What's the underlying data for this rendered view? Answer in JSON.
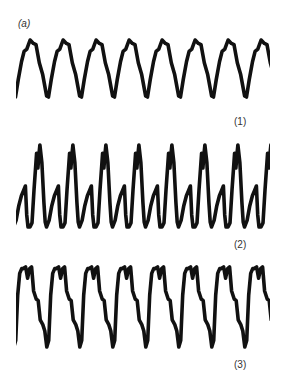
{
  "figure": {
    "panel_label": "(a)",
    "trace_labels": [
      "(1)",
      "(2)",
      "(3)"
    ],
    "stroke_color": "#111111",
    "background": "#ffffff"
  },
  "chart_data": {
    "type": "line",
    "title": "(a)",
    "xlabel": "",
    "ylabel": "",
    "grid": false,
    "axes_visible": false,
    "legend": "none; traces labeled (1), (2), (3) at lower right of each trace",
    "series": [
      {
        "name": "(1)",
        "description": "Near-sinusoidal triangular periodic waveform, ~7.5 cycles, with small shoulder on falling edge",
        "cycles": 7.5,
        "period_px": 33,
        "x_range_px": [
          16,
          269
        ],
        "y_range_px": [
          40,
          97
        ],
        "cycle_shape": [
          [
            0,
            0.92
          ],
          [
            0.1,
            0.6
          ],
          [
            0.2,
            0.4
          ],
          [
            0.32,
            0.02
          ],
          [
            0.38,
            0.0
          ],
          [
            0.46,
            0.3
          ],
          [
            0.56,
            0.62
          ],
          [
            0.64,
            0.8
          ],
          [
            0.72,
            0.84
          ],
          [
            0.82,
            1.0
          ],
          [
            0.92,
            0.94
          ],
          [
            1.0,
            0.92
          ]
        ],
        "x0_px": 3,
        "y_top_px": 40,
        "y_bottom_px": 97
      },
      {
        "name": "(2)",
        "description": "Periodic waveform with sharp deep trough, notched bottom and double-humped top (M-shape), ~7.5 cycles",
        "cycles": 7.5,
        "period_px": 33,
        "x_range_px": [
          16,
          269
        ],
        "y_range_px": [
          145,
          227
        ],
        "cycle_shape": [
          [
            0,
            0.0
          ],
          [
            0.06,
            0.05
          ],
          [
            0.12,
            0.45
          ],
          [
            0.2,
            0.9
          ],
          [
            0.24,
            0.72
          ],
          [
            0.27,
            0.88
          ],
          [
            0.3,
            1.0
          ],
          [
            0.36,
            0.78
          ],
          [
            0.42,
            0.3
          ],
          [
            0.46,
            0.06
          ],
          [
            0.5,
            0.0
          ],
          [
            0.58,
            0.08
          ],
          [
            0.66,
            0.26
          ],
          [
            0.74,
            0.38
          ],
          [
            0.8,
            0.44
          ],
          [
            0.86,
            0.5
          ],
          [
            0.9,
            0.15
          ],
          [
            0.94,
            0.0
          ],
          [
            1.0,
            0.0
          ]
        ],
        "x0_px": -3,
        "y_top_px": 145,
        "y_bottom_px": 227
      },
      {
        "name": "(3)",
        "description": "Periodic waveform with flat double-peaked top and stepped descent to deep sharp trough, ~7.5 cycles",
        "cycles": 7.5,
        "period_px": 33,
        "x_range_px": [
          16,
          269
        ],
        "y_range_px": [
          267,
          347
        ],
        "cycle_shape": [
          [
            0,
            0.98
          ],
          [
            0.08,
            1.0
          ],
          [
            0.14,
            0.86
          ],
          [
            0.2,
            0.98
          ],
          [
            0.26,
            1.0
          ],
          [
            0.32,
            0.7
          ],
          [
            0.4,
            0.6
          ],
          [
            0.46,
            0.58
          ],
          [
            0.52,
            0.34
          ],
          [
            0.6,
            0.28
          ],
          [
            0.66,
            0.2
          ],
          [
            0.72,
            0.0
          ],
          [
            0.78,
            0.08
          ],
          [
            0.84,
            0.65
          ],
          [
            0.9,
            0.92
          ],
          [
            0.96,
            0.98
          ],
          [
            1.0,
            0.98
          ]
        ],
        "x0_px": -10,
        "y_top_px": 267,
        "y_bottom_px": 347
      }
    ]
  }
}
